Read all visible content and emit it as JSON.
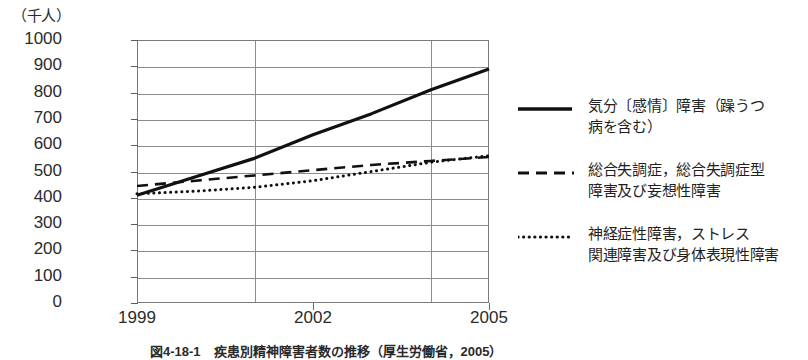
{
  "chart_data": {
    "type": "line",
    "title": "",
    "unit_label": "（千人）",
    "xlabel": "",
    "ylabel": "",
    "ylim": [
      0,
      1000
    ],
    "ytick_step": 100,
    "yticks": [
      1000,
      900,
      800,
      700,
      600,
      500,
      400,
      300,
      200,
      100,
      0
    ],
    "grid": true,
    "legend_position": "right",
    "x": [
      1999,
      2000,
      2001,
      2002,
      2003,
      2004,
      2005
    ],
    "xtick_labels": [
      "1999",
      "2002",
      "2005"
    ],
    "xtick_values": [
      1999,
      2002,
      2005
    ],
    "gridline_years": [
      2001,
      2004,
      2005
    ],
    "series": [
      {
        "name": "気分〔感情〕障害（躁うつ病を含む）",
        "style": "solid",
        "values": [
          410,
          480,
          550,
          640,
          720,
          810,
          890
        ]
      },
      {
        "name": "総合失調症，総合失調症型障害及び妄想性障害",
        "style": "dashed",
        "values": [
          445,
          465,
          485,
          505,
          525,
          540,
          555
        ]
      },
      {
        "name": "神経症性障害，ストレス関連障害及び身体表現性障害",
        "style": "dotted",
        "values": [
          415,
          425,
          440,
          465,
          500,
          535,
          560
        ]
      }
    ]
  },
  "legend": {
    "entries": [
      {
        "sample": "solid-line-sample",
        "label": "気分〔感情〕障害（躁うつ\n病を含む）"
      },
      {
        "sample": "dashed-line-sample",
        "label": "総合失調症，総合失調症型\n障害及び妄想性障害"
      },
      {
        "sample": "dotted-line-sample",
        "label": "神経症性障害，ストレス\n関連障害及び身体表現性障害"
      }
    ]
  },
  "caption": {
    "text": "図4-18-1　疾患別精神障害者数の推移（厚生労働省，2005）"
  },
  "colors": {
    "line": "#111111",
    "grid": "#8d8d8d",
    "axis": "#7a7a7a",
    "text": "#1f1f1f",
    "background": "#ffffff"
  }
}
